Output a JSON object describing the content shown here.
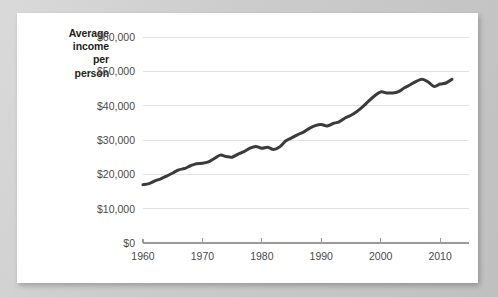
{
  "card": {
    "background_color": "#ffffff",
    "page_background_color": "#cacaca"
  },
  "chart_data": {
    "type": "line",
    "title": "Average income per person",
    "title_lines": [
      "Average",
      "income",
      "per",
      "person"
    ],
    "xlabel": "",
    "ylabel": "Average income per person",
    "xlim": [
      1960,
      2012
    ],
    "ylim": [
      0,
      60000
    ],
    "grid": true,
    "legend": "none",
    "line_color": "#3b3b3b",
    "y_tick_labels": [
      "$60,000",
      "$50,000",
      "$40,000",
      "$30,000",
      "$20,000",
      "$10,000",
      "$0"
    ],
    "y_tick_values": [
      60000,
      50000,
      40000,
      30000,
      20000,
      10000,
      0
    ],
    "x_tick_labels": [
      "1960",
      "1970",
      "1980",
      "1990",
      "2000",
      "2010"
    ],
    "x_tick_values": [
      1960,
      1970,
      1980,
      1990,
      2000,
      2010
    ],
    "series": [
      {
        "name": "Average income per person",
        "x": [
          1960,
          1961,
          1962,
          1963,
          1964,
          1965,
          1966,
          1967,
          1968,
          1969,
          1970,
          1971,
          1972,
          1973,
          1974,
          1975,
          1976,
          1977,
          1978,
          1979,
          1980,
          1981,
          1982,
          1983,
          1984,
          1985,
          1986,
          1987,
          1988,
          1989,
          1990,
          1991,
          1992,
          1993,
          1994,
          1995,
          1996,
          1997,
          1998,
          1999,
          2000,
          2001,
          2002,
          2003,
          2004,
          2005,
          2006,
          2007,
          2008,
          2009,
          2010,
          2011,
          2012
        ],
        "values": [
          17000,
          17300,
          18100,
          18700,
          19500,
          20400,
          21300,
          21700,
          22500,
          23100,
          23200,
          23600,
          24600,
          25600,
          25200,
          25000,
          25900,
          26600,
          27600,
          28100,
          27600,
          27900,
          27200,
          28000,
          29700,
          30600,
          31500,
          32300,
          33400,
          34200,
          34500,
          34100,
          34800,
          35300,
          36400,
          37200,
          38300,
          39700,
          41400,
          42900,
          44000,
          43700,
          43700,
          44100,
          45200,
          46100,
          47100,
          47700,
          46900,
          45600,
          46300,
          46600,
          47700
        ]
      }
    ],
    "annotations": []
  }
}
